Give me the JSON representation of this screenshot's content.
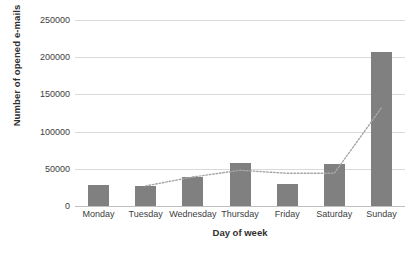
{
  "chart_data": {
    "type": "bar",
    "title": "",
    "categories": [
      "Monday",
      "Tuesday",
      "Wednesday",
      "Thursday",
      "Friday",
      "Saturday",
      "Sunday"
    ],
    "values": [
      28000,
      27000,
      39000,
      58000,
      29000,
      56000,
      207000
    ],
    "series": [
      {
        "name": "Number of opened e-mails",
        "type": "bar",
        "values": [
          28000,
          27000,
          39000,
          58000,
          29000,
          56000,
          207000
        ]
      },
      {
        "name": "trendline",
        "type": "line",
        "style": "dotted",
        "color": "#a6a6a6",
        "values": [
          null,
          27000,
          39000,
          48000,
          44000,
          44000,
          132000
        ]
      }
    ],
    "xlabel": "Day of week",
    "ylabel": "Number of opened e-mails",
    "ylim": [
      0,
      250000
    ],
    "ytick_values": [
      0,
      50000,
      100000,
      150000,
      200000,
      250000
    ],
    "ytick_labels": [
      "0",
      "50000",
      "100000",
      "150000",
      "200000",
      "250000"
    ],
    "grid": true,
    "grid_axis": "y",
    "legend": false,
    "bar_color": "#808080",
    "gridline_color": "#d9d9d9",
    "background": "#ffffff"
  },
  "axes": {
    "y_title": "Number of opened e-mails",
    "x_title": "Day of week"
  }
}
